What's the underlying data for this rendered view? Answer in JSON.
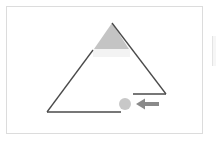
{
  "diagram": {
    "type": "triangle-with-marker",
    "colors": {
      "background": "#ffffff",
      "frame_border": "#dcdcdc",
      "line": "#4a4a4a",
      "shaded_apex": "#c4c4c4",
      "marker_circle": "#c8c8c8",
      "arrow": "#8a8a8a"
    },
    "shapes": [
      {
        "name": "triangle-apex-shaded-region",
        "kind": "filled-polygon"
      },
      {
        "name": "triangle-left-edge",
        "kind": "line"
      },
      {
        "name": "triangle-right-edge",
        "kind": "line"
      },
      {
        "name": "triangle-bottom-edge",
        "kind": "line"
      },
      {
        "name": "right-gap-ledge",
        "kind": "line"
      },
      {
        "name": "marker-circle",
        "kind": "circle"
      },
      {
        "name": "left-arrow",
        "kind": "arrow",
        "direction": "left"
      }
    ]
  }
}
